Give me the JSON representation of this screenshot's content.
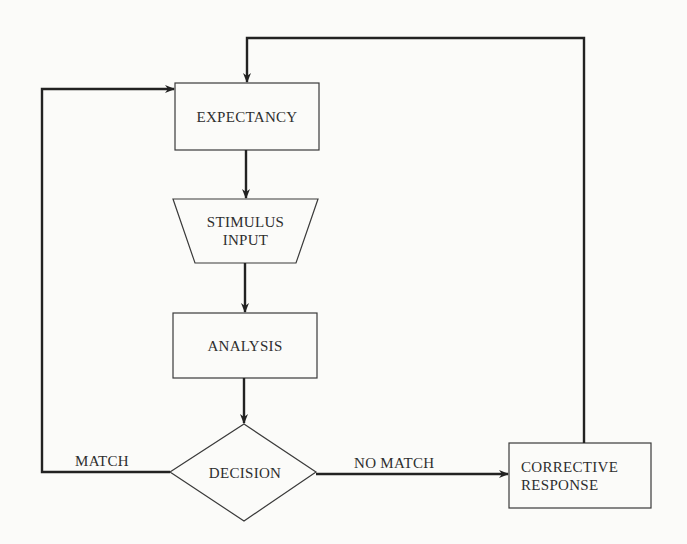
{
  "diagram": {
    "type": "flowchart",
    "nodes": {
      "expectancy": {
        "label": "EXPECTANCY",
        "shape": "rectangle"
      },
      "stimulus_input": {
        "line1": "STIMULUS",
        "line2": "INPUT",
        "shape": "trapezoid"
      },
      "analysis": {
        "label": "ANALYSIS",
        "shape": "rectangle"
      },
      "decision": {
        "label": "DECISION",
        "shape": "diamond"
      },
      "corrective_response": {
        "line1": "CORRECTIVE",
        "line2": "RESPONSE",
        "shape": "rectangle"
      }
    },
    "edges": {
      "match_label": "MATCH",
      "no_match_label": "NO MATCH"
    },
    "connections": [
      {
        "from": "EXPECTANCY",
        "to": "STIMULUS INPUT"
      },
      {
        "from": "STIMULUS INPUT",
        "to": "ANALYSIS"
      },
      {
        "from": "ANALYSIS",
        "to": "DECISION"
      },
      {
        "from": "DECISION",
        "to": "EXPECTANCY",
        "label": "MATCH"
      },
      {
        "from": "DECISION",
        "to": "CORRECTIVE RESPONSE",
        "label": "NO MATCH"
      },
      {
        "from": "CORRECTIVE RESPONSE",
        "to": "EXPECTANCY"
      }
    ],
    "colors": {
      "stroke": "#2a2a2a",
      "background": "#fbfbf9"
    }
  }
}
